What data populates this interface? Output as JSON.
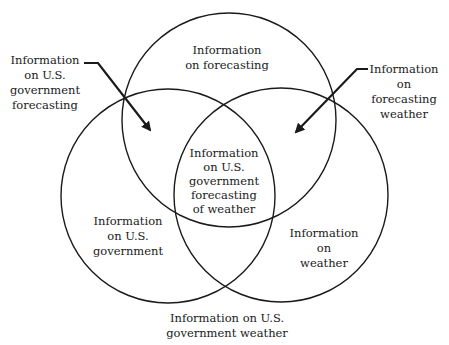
{
  "diagram": {
    "type": "venn",
    "sets": [
      {
        "id": "forecasting",
        "label_lines": [
          "Information",
          "on forecasting"
        ]
      },
      {
        "id": "government",
        "label_lines": [
          "Information",
          "on U.S.",
          "government"
        ]
      },
      {
        "id": "weather",
        "label_lines": [
          "Information",
          "on",
          "weather"
        ]
      }
    ],
    "intersections": {
      "all_three": {
        "label_lines": [
          "Information",
          "on U.S.",
          "government",
          "forecasting",
          "of weather"
        ]
      },
      "government_forecasting": {
        "label_lines": [
          "Information",
          "on U.S.",
          "government",
          "forecasting"
        ]
      },
      "forecasting_weather": {
        "label_lines": [
          "Information",
          "on",
          "forecasting",
          "weather"
        ]
      },
      "government_weather": {
        "label_lines": [
          "Information on U.S.",
          "government weather"
        ]
      }
    },
    "colors": {
      "stroke": "#1a1a1a",
      "background": "#ffffff"
    }
  }
}
